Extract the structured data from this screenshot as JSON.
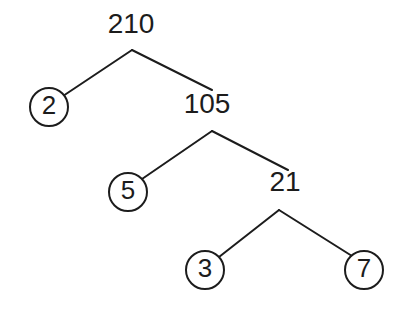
{
  "figure": {
    "name": "factor-tree",
    "background_color": "#ffffff",
    "stroke_color": "#1c1c1c",
    "width": 404,
    "height": 311
  },
  "chart_data": {
    "type": "diagram",
    "diagram_kind": "factor-tree",
    "title": "",
    "root_value": "210",
    "prime_factors": [
      "2",
      "3",
      "5",
      "7"
    ],
    "nodes": [
      {
        "id": "n210",
        "label": "210",
        "shape": "plain",
        "x": 131,
        "y": 26,
        "level": 0,
        "is_prime": false
      },
      {
        "id": "n2",
        "label": "2",
        "shape": "circle",
        "x": 49,
        "y": 107,
        "level": 1,
        "is_prime": true
      },
      {
        "id": "n105",
        "label": "105",
        "shape": "plain",
        "x": 207,
        "y": 106,
        "level": 1,
        "is_prime": false
      },
      {
        "id": "n5",
        "label": "5",
        "shape": "circle",
        "x": 128,
        "y": 192,
        "level": 2,
        "is_prime": true
      },
      {
        "id": "n21",
        "label": "21",
        "shape": "plain",
        "x": 285,
        "y": 184,
        "level": 2,
        "is_prime": false
      },
      {
        "id": "n3",
        "label": "3",
        "shape": "circle",
        "x": 205,
        "y": 270,
        "level": 3,
        "is_prime": true
      },
      {
        "id": "n7",
        "label": "7",
        "shape": "circle",
        "x": 364,
        "y": 270,
        "level": 3,
        "is_prime": true
      }
    ],
    "edges": [
      {
        "id": "e210-2",
        "from": "n210",
        "to": "n2",
        "x1": 132,
        "y1": 50,
        "x2": 63,
        "y2": 96
      },
      {
        "id": "e210-105",
        "from": "n210",
        "to": "n105",
        "x1": 132,
        "y1": 50,
        "x2": 212,
        "y2": 90
      },
      {
        "id": "e105-5",
        "from": "n105",
        "to": "n5",
        "x1": 212,
        "y1": 131,
        "x2": 142,
        "y2": 179
      },
      {
        "id": "e105-21",
        "from": "n105",
        "to": "n21",
        "x1": 212,
        "y1": 131,
        "x2": 288,
        "y2": 170
      },
      {
        "id": "e21-3",
        "from": "n21",
        "to": "n3",
        "x1": 279,
        "y1": 210,
        "x2": 219,
        "y2": 257
      },
      {
        "id": "e21-7",
        "from": "n21",
        "to": "n7",
        "x1": 279,
        "y1": 210,
        "x2": 352,
        "y2": 256
      }
    ],
    "circle_radius": 19
  }
}
